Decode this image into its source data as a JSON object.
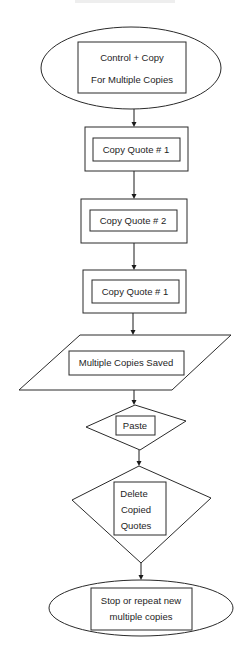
{
  "diagram": {
    "type": "flowchart",
    "nodes": [
      {
        "id": "start",
        "shape": "ellipse",
        "lines": [
          "Control + Copy",
          "For Multiple Copies"
        ]
      },
      {
        "id": "copy1",
        "shape": "process",
        "lines": [
          "Copy Quote # 1"
        ]
      },
      {
        "id": "copy2",
        "shape": "process",
        "lines": [
          "Copy Quote # 2"
        ]
      },
      {
        "id": "copy3",
        "shape": "process",
        "lines": [
          "Copy Quote # 1"
        ]
      },
      {
        "id": "saved",
        "shape": "parallelogram",
        "lines": [
          "Multiple Copies Saved"
        ]
      },
      {
        "id": "paste",
        "shape": "diamond",
        "lines": [
          "Paste"
        ]
      },
      {
        "id": "delete",
        "shape": "diamond",
        "lines": [
          "Delete",
          "Copied",
          "Quotes"
        ]
      },
      {
        "id": "end",
        "shape": "ellipse",
        "lines": [
          "Stop or repeat new",
          "multiple copies"
        ]
      }
    ],
    "edges": [
      {
        "from": "start",
        "to": "copy1"
      },
      {
        "from": "copy1",
        "to": "copy2"
      },
      {
        "from": "copy2",
        "to": "copy3"
      },
      {
        "from": "copy3",
        "to": "saved"
      },
      {
        "from": "saved",
        "to": "paste"
      },
      {
        "from": "paste",
        "to": "delete"
      },
      {
        "from": "delete",
        "to": "end"
      }
    ]
  }
}
